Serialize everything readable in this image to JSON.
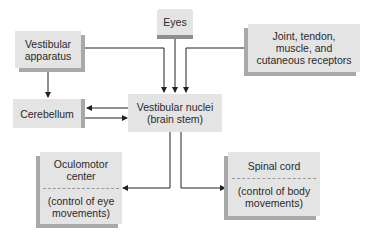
{
  "diagram": {
    "nodes": {
      "vestibular_apparatus": {
        "line1": "Vestibular",
        "line2": "apparatus"
      },
      "eyes": {
        "label": "Eyes"
      },
      "receptors": {
        "line1": "Joint, tendon,",
        "line2": "muscle, and",
        "line3": "cutaneous receptors"
      },
      "cerebellum": {
        "label": "Cerebellum"
      },
      "vestibular_nuclei": {
        "line1": "Vestibular nuclei",
        "line2": "(brain stem)"
      },
      "oculomotor": {
        "title1": "Oculomotor",
        "title2": "center",
        "desc1": "(control of eye",
        "desc2": "movements)"
      },
      "spinal_cord": {
        "title": "Spinal cord",
        "desc1": "(control of body",
        "desc2": "movements)"
      }
    },
    "edges": [
      {
        "from": "vestibular_apparatus",
        "to": "vestibular_nuclei"
      },
      {
        "from": "vestibular_apparatus",
        "to": "cerebellum"
      },
      {
        "from": "eyes",
        "to": "vestibular_nuclei"
      },
      {
        "from": "receptors",
        "to": "vestibular_nuclei"
      },
      {
        "from": "vestibular_nuclei",
        "to": "cerebellum"
      },
      {
        "from": "cerebellum",
        "to": "vestibular_nuclei"
      },
      {
        "from": "vestibular_nuclei",
        "to": "oculomotor"
      },
      {
        "from": "vestibular_nuclei",
        "to": "spinal_cord"
      }
    ],
    "colors": {
      "box": "#e4e4e4",
      "shade": "#a9a9a9",
      "line": "#222222"
    }
  }
}
